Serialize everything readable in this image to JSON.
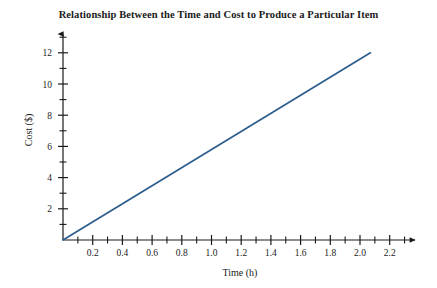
{
  "chart_data": {
    "type": "line",
    "title": "Relationship Between the Time and Cost to Produce a Particular Item",
    "xlabel": "Time (h)",
    "ylabel": "Cost ($)",
    "xlim": [
      0,
      2.35
    ],
    "ylim": [
      0,
      12.9
    ],
    "grid": false,
    "legend": null,
    "x_major_ticks": [
      0.2,
      0.4,
      0.6,
      0.8,
      1.0,
      1.2,
      1.4,
      1.6,
      1.8,
      2.0,
      2.2
    ],
    "x_major_tick_labels": [
      "0.2",
      "0.4",
      "0.6",
      "0.8",
      "1.0",
      "1.2",
      "1.4",
      "1.6",
      "1.8",
      "2.0",
      "2.2"
    ],
    "x_minor_ticks": [
      0.1,
      0.3,
      0.5,
      0.7,
      0.9,
      1.1,
      1.3,
      1.5,
      1.7,
      1.9,
      2.1,
      2.3
    ],
    "y_major_ticks": [
      2,
      4,
      6,
      8,
      10,
      12
    ],
    "y_major_tick_labels": [
      "2",
      "4",
      "6",
      "8",
      "10",
      "12"
    ],
    "y_minor_ticks": [
      1,
      3,
      5,
      7,
      9,
      11
    ],
    "series": [
      {
        "name": "cost-vs-time",
        "color": "#2d5d8e",
        "points": [
          {
            "x": 0.0,
            "y": 0.0
          },
          {
            "x": 2.07,
            "y": 12.0
          }
        ],
        "slope": 5.8,
        "intercept": 0.0
      }
    ],
    "axis_color": "#1a1a1a",
    "background": "#ffffff"
  }
}
